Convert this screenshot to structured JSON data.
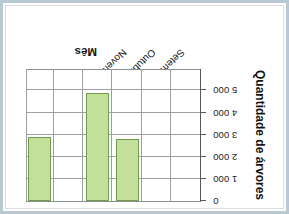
{
  "figure": {
    "background_color": "#ffffff",
    "frame_color": "#b9c9d4"
  },
  "chart_data": {
    "type": "bar",
    "title": "",
    "orientation": "vertical-inverted",
    "rotated_180": true,
    "categories": [
      "Setembro",
      "Outubro",
      "Novembro"
    ],
    "values": [
      2800,
      4900,
      2900
    ],
    "xlabel": "Mês",
    "ylabel": "Quantidade de árvores",
    "ylim": [
      0,
      5500
    ],
    "ytick_values": [
      0,
      1000,
      2000,
      3000,
      4000,
      5000
    ],
    "ytick_labels": [
      "0",
      "1 000",
      "2 000",
      "3 000",
      "4 000",
      "5 000"
    ],
    "grid": true,
    "legend": "none",
    "bar_fill_color": "#c3e09a",
    "bar_edge_color": "#6f9c4d",
    "grid_color": "#9a9fa3",
    "axis_color": "#55595d",
    "n_columns": 6,
    "bar_columns": [
      3,
      4,
      6
    ]
  },
  "axis": {
    "value_axis_title": "Quantidade de árvores",
    "category_axis_title": "Mês",
    "ticks": [
      {
        "label": "0",
        "value": 0
      },
      {
        "label": "1 000",
        "value": 1000
      },
      {
        "label": "2 000",
        "value": 2000
      },
      {
        "label": "3 000",
        "value": 3000
      },
      {
        "label": "4 000",
        "value": 4000
      },
      {
        "label": "5 000",
        "value": 5000
      }
    ]
  },
  "bars": [
    {
      "label": "Setembro",
      "value": 2800
    },
    {
      "label": "Outubro",
      "value": 4900
    },
    {
      "label": "Novembro",
      "value": 2900
    }
  ]
}
